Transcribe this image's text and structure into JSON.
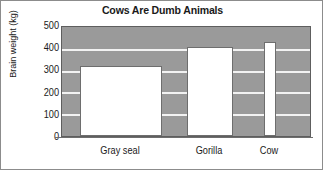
{
  "chart_data": {
    "type": "bar",
    "title": "Cows Are Dumb Animals",
    "xlabel": "",
    "ylabel": "Brain weight (kg)",
    "categories": [
      "Gray seal",
      "Gorilla",
      "Cow"
    ],
    "values": [
      320,
      410,
      430
    ],
    "ylim": [
      0,
      500
    ],
    "yticks": [
      0,
      100,
      200,
      300,
      400,
      500
    ],
    "ytick_labels": [
      "0",
      "100",
      "200",
      "300",
      "400",
      "500"
    ],
    "grid": true,
    "legend": "none",
    "bar_color": "#ffffff",
    "plot_background": "#9a9a9a",
    "gridline_color": "#f2f2f2",
    "axis_color": "#5e5e5e",
    "text_color": "#1a1a1a",
    "bar_geometry": [
      {
        "category": "Gray seal",
        "value": 320,
        "left_pct": 7.2,
        "width_pct": 33.0
      },
      {
        "category": "Gorilla",
        "value": 410,
        "left_pct": 50.5,
        "width_pct": 18.5
      },
      {
        "category": "Cow",
        "value": 430,
        "left_pct": 81.5,
        "width_pct": 4.6
      }
    ],
    "category_centers_pct": [
      23.7,
      59.8,
      83.8
    ]
  }
}
